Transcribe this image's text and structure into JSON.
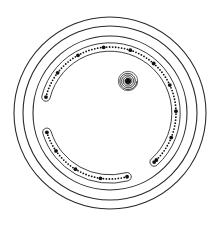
{
  "diagram": {
    "width": 221,
    "height": 227,
    "background": "#ffffff",
    "stroke_color": "#2a2a2a",
    "bead_color": "#111111",
    "center": [
      110,
      113
    ],
    "rings": [
      {
        "r": 96,
        "stroke_width": 1.1
      },
      {
        "r": 87,
        "stroke_width": 1.1
      },
      {
        "r": 77,
        "stroke_width": 1.1
      }
    ],
    "track": {
      "radius": 66,
      "half_width": 4.2,
      "stroke_width": 0.9,
      "segments": [
        {
          "name": "upper-arc",
          "start_deg": 194,
          "end_deg": 408
        },
        {
          "name": "lower-arc",
          "start_deg": 75,
          "end_deg": 163
        }
      ],
      "small_bead_spacing_deg": 2.6,
      "small_bead_r": 0.9,
      "large_bead_r": 1.9,
      "large_bead_every": 9
    },
    "spiral": {
      "center": [
        128,
        81
      ],
      "outer_r": 8.5,
      "turns": 5
    }
  }
}
